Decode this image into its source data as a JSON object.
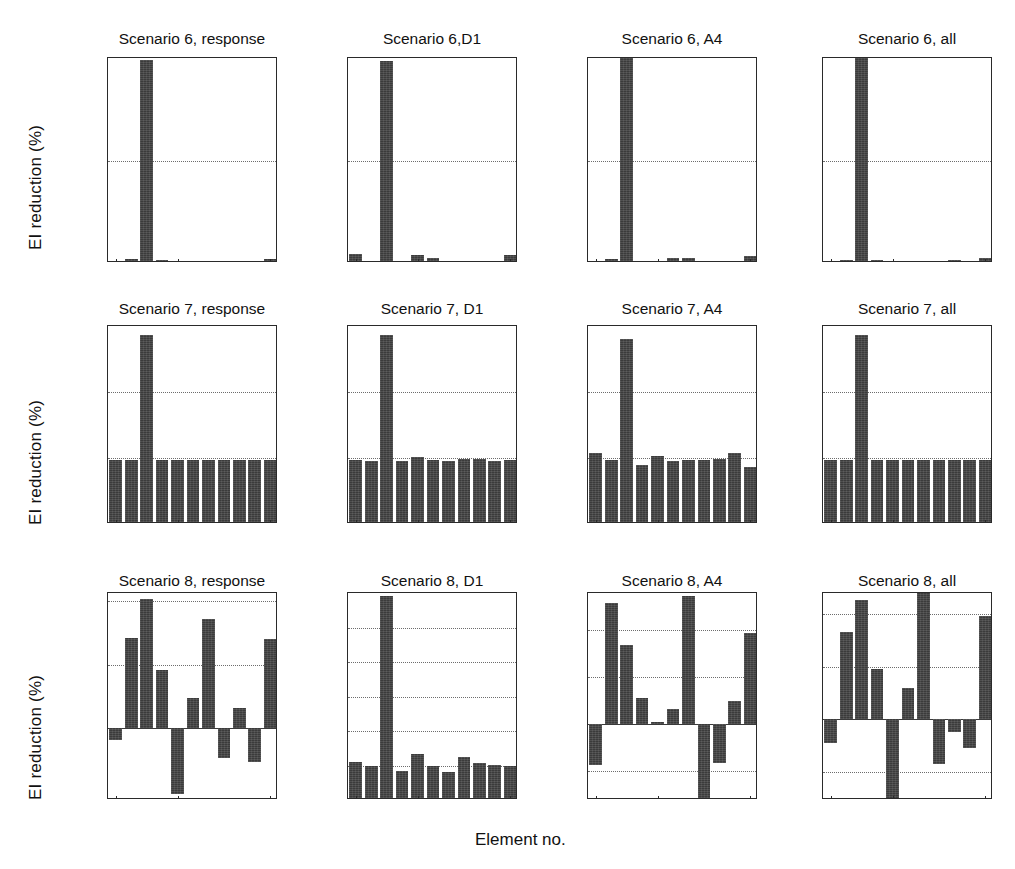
{
  "figure": {
    "ylabel": "EI reduction (%)",
    "xlabel": "Element no.",
    "bar_color": "#3b3b3b",
    "grid_color": "#6d6d6d",
    "axis_color": "#2a2a2a",
    "rows": 3,
    "cols": 4
  },
  "chart_data": [
    {
      "type": "bar",
      "title": "Scenario 6, response",
      "xlabel": "Element no.",
      "ylabel": "EI reduction (%)",
      "categories": [
        1,
        2,
        3,
        4,
        5,
        6,
        7,
        8,
        9,
        10,
        11
      ],
      "values": [
        0.05,
        0.18,
        9.9,
        0.13,
        0.1,
        0.05,
        0.04,
        0.04,
        0.12,
        0.06,
        0.18
      ],
      "ylim": [
        0,
        10
      ],
      "yticks": [
        0,
        5,
        10
      ],
      "ytick_labels": [
        "0",
        "5",
        "10"
      ],
      "xticks": [
        1,
        5,
        11
      ],
      "xtick_labels": [
        "1",
        "5",
        "11"
      ],
      "grid": true,
      "legend": null
    },
    {
      "type": "bar",
      "title": "Scenario 6,D1",
      "xlabel": "Element no.",
      "ylabel": "EI reduction (%)",
      "categories": [
        1,
        2,
        3,
        4,
        5,
        6,
        7,
        8,
        9,
        10,
        11
      ],
      "values": [
        0.45,
        0.12,
        9.85,
        -0.3,
        0.4,
        0.22,
        -0.18,
        -0.1,
        -0.05,
        0.02,
        0.38
      ],
      "ylim": [
        0,
        10
      ],
      "yticks": [
        0,
        5,
        10
      ],
      "ytick_labels": [
        "0",
        "5",
        "10"
      ],
      "xticks": [
        1,
        5,
        11
      ],
      "xtick_labels": [
        "1",
        "5",
        "11"
      ],
      "grid": true,
      "legend": null
    },
    {
      "type": "bar",
      "title": "Scenario 6, A4",
      "xlabel": "Element no.",
      "ylabel": "EI reduction (%)",
      "categories": [
        1,
        2,
        3,
        4,
        5,
        6,
        7,
        8,
        9,
        10,
        11
      ],
      "values": [
        0.04,
        0.2,
        10.0,
        0.1,
        0.06,
        0.22,
        0.24,
        0.05,
        0.07,
        0.1,
        0.35
      ],
      "ylim": [
        0,
        10
      ],
      "yticks": [
        0,
        5,
        10
      ],
      "ytick_labels": [
        "0",
        "5",
        "10"
      ],
      "xticks": [
        1,
        5,
        11
      ],
      "xtick_labels": [
        "1",
        "5",
        "11"
      ],
      "grid": true,
      "legend": null
    },
    {
      "type": "bar",
      "title": "Scenario 6, all",
      "xlabel": "Element no.",
      "ylabel": "EI reduction (%)",
      "categories": [
        1,
        2,
        3,
        4,
        5,
        6,
        7,
        8,
        9,
        10,
        11
      ],
      "values": [
        0.04,
        0.15,
        10.0,
        0.13,
        0.1,
        0.05,
        0.06,
        0.1,
        0.16,
        0.07,
        0.26
      ],
      "ylim": [
        0,
        10
      ],
      "yticks": [
        0,
        5,
        10
      ],
      "ytick_labels": [
        "0",
        "5",
        "10"
      ],
      "xticks": [
        1,
        5,
        11
      ],
      "xtick_labels": [
        "1",
        "5",
        "11"
      ],
      "grid": true,
      "legend": null
    },
    {
      "type": "bar",
      "title": "Scenario 7, response",
      "xlabel": "Element no.",
      "ylabel": "EI reduction (%)",
      "categories": [
        1,
        2,
        3,
        4,
        5,
        6,
        7,
        8,
        9,
        10,
        11
      ],
      "values": [
        4.85,
        4.85,
        14.35,
        4.85,
        4.85,
        4.85,
        4.85,
        4.85,
        4.85,
        4.85,
        4.85
      ],
      "ylim": [
        0,
        15
      ],
      "yticks": [
        0,
        5,
        10,
        15
      ],
      "ytick_labels": [
        "0",
        "5",
        "10",
        "15"
      ],
      "xticks": [
        1,
        5,
        11
      ],
      "xtick_labels": [
        "1",
        "5",
        "11"
      ],
      "grid": true,
      "legend": null
    },
    {
      "type": "bar",
      "title": "Scenario 7, D1",
      "xlabel": "Element no.",
      "ylabel": "EI reduction (%)",
      "categories": [
        1,
        2,
        3,
        4,
        5,
        6,
        7,
        8,
        9,
        10,
        11
      ],
      "values": [
        4.85,
        4.8,
        14.3,
        4.75,
        5.05,
        4.85,
        4.8,
        4.95,
        4.95,
        4.8,
        4.85
      ],
      "ylim": [
        0,
        15
      ],
      "yticks": [
        0,
        5,
        10,
        15
      ],
      "ytick_labels": [
        "0",
        "5",
        "10",
        "15"
      ],
      "xticks": [
        1,
        5,
        11
      ],
      "xtick_labels": [
        "1",
        "5",
        "11"
      ],
      "grid": true,
      "legend": null
    },
    {
      "type": "bar",
      "title": "Scenario 7, A4",
      "xlabel": "Element no.",
      "ylabel": "EI reduction (%)",
      "categories": [
        1,
        2,
        3,
        4,
        5,
        6,
        7,
        8,
        9,
        10,
        11
      ],
      "values": [
        5.35,
        4.85,
        14.0,
        4.5,
        5.15,
        4.8,
        4.85,
        4.85,
        4.95,
        5.35,
        4.35
      ],
      "ylim": [
        0,
        15
      ],
      "yticks": [
        0,
        5,
        10,
        15
      ],
      "ytick_labels": [
        "0",
        "5",
        "10",
        "15"
      ],
      "xticks": [
        1,
        5,
        11
      ],
      "xtick_labels": [
        "1",
        "5",
        "11"
      ],
      "grid": true,
      "legend": null
    },
    {
      "type": "bar",
      "title": "Scenario 7, all",
      "xlabel": "Element no.",
      "ylabel": "EI reduction (%)",
      "categories": [
        1,
        2,
        3,
        4,
        5,
        6,
        7,
        8,
        9,
        10,
        11
      ],
      "values": [
        4.85,
        4.85,
        14.35,
        4.85,
        4.85,
        4.85,
        4.85,
        4.85,
        4.85,
        4.85,
        4.85
      ],
      "ylim": [
        0,
        15
      ],
      "yticks": [
        0,
        5,
        10,
        15
      ],
      "ytick_labels": [
        "0",
        "5",
        "10",
        "15"
      ],
      "xticks": [
        1,
        5,
        11
      ],
      "xtick_labels": [
        "1",
        "5",
        "11"
      ],
      "grid": true,
      "legend": null
    },
    {
      "type": "bar",
      "title": "Scenario 8, response",
      "xlabel": "Element no.",
      "ylabel": "EI reduction (%)",
      "categories": [
        1,
        2,
        3,
        4,
        5,
        6,
        7,
        8,
        9,
        10,
        11
      ],
      "values": [
        -0.9,
        7.1,
        10.1,
        4.6,
        -5.1,
        2.4,
        8.6,
        -2.3,
        1.6,
        -2.6,
        7.0
      ],
      "ylim": [
        -5.6,
        10.6
      ],
      "yticks": [
        0,
        5,
        10
      ],
      "ytick_labels": [
        "0",
        "5",
        "10"
      ],
      "xticks": [
        1,
        5,
        11
      ],
      "xtick_labels": [
        "1",
        "5",
        "11"
      ],
      "grid": true,
      "legend": null
    },
    {
      "type": "bar",
      "title": "Scenario 8, D1",
      "xlabel": "Element no.",
      "ylabel": "EI reduction (%)",
      "categories": [
        1,
        2,
        3,
        4,
        5,
        6,
        7,
        8,
        9,
        10,
        11
      ],
      "values": [
        2.2,
        2.0,
        11.8,
        1.7,
        2.65,
        1.95,
        1.6,
        2.5,
        2.15,
        2.05,
        1.95
      ],
      "ylim": [
        0,
        12
      ],
      "yticks": [
        0,
        2,
        4,
        6,
        8,
        10,
        12
      ],
      "ytick_labels": [
        "0",
        "2",
        "4",
        "6",
        "8",
        "10",
        "12"
      ],
      "xticks": [
        1,
        5,
        11
      ],
      "xtick_labels": [
        "1",
        "5",
        "11"
      ],
      "grid": true,
      "legend": null
    },
    {
      "type": "bar",
      "title": "Scenario 8, A4",
      "xlabel": "Element no.",
      "ylabel": "EI reduction (%)",
      "categories": [
        1,
        2,
        3,
        4,
        5,
        6,
        7,
        8,
        9,
        10,
        11
      ],
      "values": [
        -4.4,
        12.9,
        8.5,
        2.8,
        0.25,
        1.6,
        13.7,
        -7.9,
        -4.2,
        2.5,
        9.7
      ],
      "ylim": [
        -8.1,
        14
      ],
      "yticks": [
        -5,
        0,
        5,
        10,
        14
      ],
      "ytick_labels": [
        "-5",
        "0",
        "5",
        "10",
        "14"
      ],
      "xticks": [
        1,
        5,
        11
      ],
      "xtick_labels": [
        "1",
        "5",
        "11"
      ],
      "grid": true,
      "legend": null
    },
    {
      "type": "bar",
      "title": "Scenario 8, all",
      "xlabel": "Element no.",
      "ylabel": "EI reduction (%)",
      "categories": [
        1,
        2,
        3,
        4,
        5,
        6,
        7,
        8,
        9,
        10,
        11
      ],
      "values": [
        -2.3,
        8.3,
        11.3,
        4.75,
        -7.6,
        3.0,
        12.0,
        -4.3,
        -1.2,
        -2.8,
        9.8
      ],
      "ylim": [
        -7.7,
        12
      ],
      "yticks": [
        -5,
        0,
        5,
        10,
        12
      ],
      "ytick_labels": [
        "-5",
        "0",
        "5",
        "10",
        "12"
      ],
      "xticks": [
        1,
        5,
        11
      ],
      "xtick_labels": [
        "1",
        "5",
        "11"
      ],
      "grid": true,
      "legend": null
    }
  ]
}
